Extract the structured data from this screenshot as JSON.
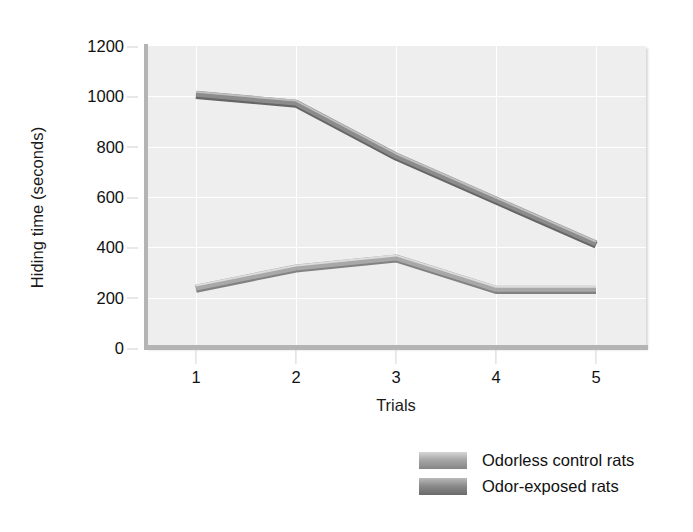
{
  "chart_data": {
    "type": "line",
    "title": "",
    "xlabel": "Trials",
    "ylabel": "Hiding time (seconds)",
    "categories": [
      "1",
      "2",
      "3",
      "4",
      "5"
    ],
    "x": [
      1,
      2,
      3,
      4,
      5
    ],
    "xlim": [
      0.5,
      5.5
    ],
    "ylim": [
      0,
      1200
    ],
    "yticks": [
      0,
      200,
      400,
      600,
      800,
      1000,
      1200
    ],
    "xticks": [
      1,
      2,
      3,
      4,
      5
    ],
    "grid": true,
    "legend_position": "below-right",
    "plot_background": "#eeeeee",
    "series": [
      {
        "name": "Odorless control rats",
        "color": "#a8a8a8",
        "values": [
          240,
          320,
          360,
          235,
          235
        ]
      },
      {
        "name": "Odor-exposed rats",
        "color": "#8c8c8c",
        "values": [
          1010,
          975,
          765,
          590,
          415
        ]
      }
    ]
  },
  "axes": {
    "y_title": "Hiding time (seconds)",
    "x_title": "Trials",
    "y_ticklabels": [
      "1200",
      "1000",
      "800",
      "600",
      "400",
      "200",
      "0"
    ],
    "x_ticklabels": [
      "1",
      "2",
      "3",
      "4",
      "5"
    ]
  },
  "legend": {
    "items": [
      {
        "label": "Odorless control rats",
        "color": "#a8a8a8"
      },
      {
        "label": "Odor-exposed rats",
        "color": "#8c8c8c"
      }
    ]
  }
}
